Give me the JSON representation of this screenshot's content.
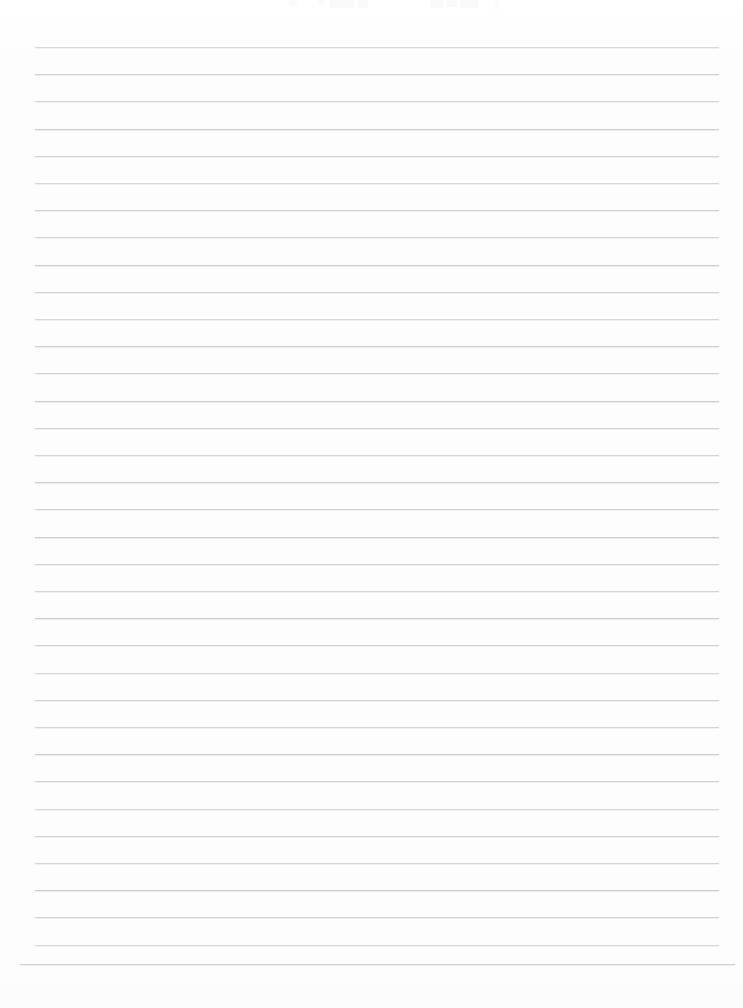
{
  "document": {
    "kind": "scanned-lined-paper",
    "title": "Blank ruled notebook page",
    "page_width": 743,
    "page_height": 1008,
    "background_color": "#fdfdfd",
    "content_text": "",
    "notes": "Empty scanned sheet of ruled paper; no handwriting or printed text is legible."
  },
  "ruling": {
    "line_color": "#c9cace",
    "line_count": 35,
    "first_line_y": 47,
    "line_spacing": 27.2,
    "line_left_x": 35,
    "line_right_x": 719,
    "line_thickness": 1,
    "last_line": {
      "index": 34,
      "y": 964,
      "left_x": 20,
      "right_x": 735
    }
  },
  "margins": {
    "top": 47,
    "bottom": 44,
    "left": 35,
    "right": 24
  },
  "scan_artifacts": [
    {
      "x": 289,
      "width": 9,
      "height": 7,
      "opacity": 0.5
    },
    {
      "x": 318,
      "width": 6,
      "height": 6,
      "opacity": 0.45
    },
    {
      "x": 330,
      "width": 24,
      "height": 8,
      "opacity": 0.7
    },
    {
      "x": 358,
      "width": 10,
      "height": 8,
      "opacity": 0.6
    },
    {
      "x": 430,
      "width": 13,
      "height": 8,
      "opacity": 0.65
    },
    {
      "x": 446,
      "width": 11,
      "height": 7,
      "opacity": 0.6
    },
    {
      "x": 460,
      "width": 18,
      "height": 8,
      "opacity": 0.7
    },
    {
      "x": 495,
      "width": 4,
      "height": 9,
      "opacity": 0.55
    }
  ]
}
